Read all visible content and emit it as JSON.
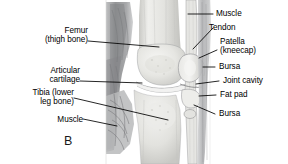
{
  "figure": {
    "panel_letter": "B",
    "style": "grayscale-medical-illustration",
    "colors": {
      "background": "#ffffff",
      "text": "#000000",
      "leader_line": "#000000",
      "bone_light": "#ededea",
      "bone_mid": "#d8d8d4",
      "muscle_dark": "#8f9092",
      "muscle_mid": "#b4b5b6",
      "outline": "#6b6c6e"
    }
  },
  "labels": {
    "femur": {
      "line1": "Femur",
      "line2": "(thigh bone)"
    },
    "articular_cartilage": {
      "line1": "Articular",
      "line2": "cartilage"
    },
    "tibia": {
      "line1": "Tibia (lower",
      "line2": "leg bone)"
    },
    "muscle_left": {
      "line1": "Muscle"
    },
    "muscle_right": {
      "line1": "Muscle"
    },
    "tendon": {
      "line1": "Tendon"
    },
    "patella": {
      "line1": "Patella",
      "line2": "(kneecap)"
    },
    "bursa_upper": {
      "line1": "Bursa"
    },
    "joint_cavity": {
      "line1": "Joint cavity"
    },
    "fat_pad": {
      "line1": "Fat pad"
    },
    "bursa_lower": {
      "line1": "Bursa"
    }
  }
}
